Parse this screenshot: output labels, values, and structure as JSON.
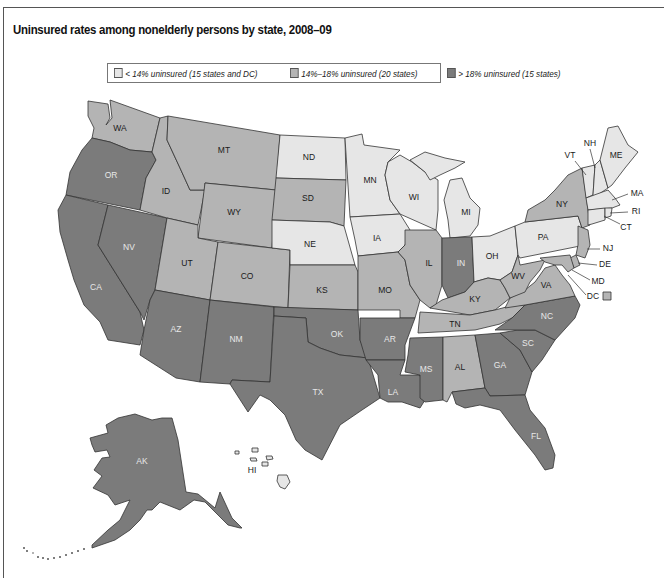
{
  "title": "Uninsured rates among nonelderly persons by state, 2008–09",
  "legend": {
    "items": [
      {
        "label": "< 14% uninsured (15 states and DC)",
        "color": "#e6e6e6",
        "category": "low"
      },
      {
        "label": "14%–18% uninsured (20 states)",
        "color": "#b4b4b4",
        "category": "mid"
      },
      {
        "label": "> 18% uninsured (15 states)",
        "color": "#7b7b7b",
        "category": "high"
      }
    ]
  },
  "colors": {
    "low": "#e6e6e6",
    "mid": "#b4b4b4",
    "high": "#7b7b7b",
    "border": "#333333",
    "frame": "#555555"
  },
  "states": {
    "WA": {
      "label": "WA",
      "category": "mid"
    },
    "OR": {
      "label": "OR",
      "category": "high"
    },
    "CA": {
      "label": "CA",
      "category": "high"
    },
    "NV": {
      "label": "NV",
      "category": "high"
    },
    "ID": {
      "label": "ID",
      "category": "mid"
    },
    "MT": {
      "label": "MT",
      "category": "mid"
    },
    "WY": {
      "label": "WY",
      "category": "mid"
    },
    "UT": {
      "label": "UT",
      "category": "mid"
    },
    "CO": {
      "label": "CO",
      "category": "mid"
    },
    "AZ": {
      "label": "AZ",
      "category": "high"
    },
    "NM": {
      "label": "NM",
      "category": "high"
    },
    "ND": {
      "label": "ND",
      "category": "low"
    },
    "SD": {
      "label": "SD",
      "category": "mid"
    },
    "NE": {
      "label": "NE",
      "category": "low"
    },
    "KS": {
      "label": "KS",
      "category": "mid"
    },
    "OK": {
      "label": "OK",
      "category": "high"
    },
    "TX": {
      "label": "TX",
      "category": "high"
    },
    "MN": {
      "label": "MN",
      "category": "low"
    },
    "IA": {
      "label": "IA",
      "category": "low"
    },
    "MO": {
      "label": "MO",
      "category": "mid"
    },
    "AR": {
      "label": "AR",
      "category": "high"
    },
    "LA": {
      "label": "LA",
      "category": "high"
    },
    "WI": {
      "label": "WI",
      "category": "low"
    },
    "IL": {
      "label": "IL",
      "category": "mid"
    },
    "MI": {
      "label": "MI",
      "category": "low"
    },
    "IN": {
      "label": "IN",
      "category": "high"
    },
    "OH": {
      "label": "OH",
      "category": "low"
    },
    "KY": {
      "label": "KY",
      "category": "mid"
    },
    "TN": {
      "label": "TN",
      "category": "mid"
    },
    "MS": {
      "label": "MS",
      "category": "high"
    },
    "AL": {
      "label": "AL",
      "category": "mid"
    },
    "GA": {
      "label": "GA",
      "category": "high"
    },
    "FL": {
      "label": "FL",
      "category": "high"
    },
    "SC": {
      "label": "SC",
      "category": "high"
    },
    "NC": {
      "label": "NC",
      "category": "high"
    },
    "VA": {
      "label": "VA",
      "category": "mid"
    },
    "WV": {
      "label": "WV",
      "category": "mid"
    },
    "PA": {
      "label": "PA",
      "category": "low"
    },
    "NY": {
      "label": "NY",
      "category": "mid"
    },
    "VT": {
      "label": "VT",
      "category": "low"
    },
    "NH": {
      "label": "NH",
      "category": "low"
    },
    "ME": {
      "label": "ME",
      "category": "low"
    },
    "MA": {
      "label": "MA",
      "category": "low"
    },
    "RI": {
      "label": "RI",
      "category": "low"
    },
    "CT": {
      "label": "CT",
      "category": "low"
    },
    "NJ": {
      "label": "NJ",
      "category": "mid"
    },
    "DE": {
      "label": "DE",
      "category": "mid"
    },
    "MD": {
      "label": "MD",
      "category": "mid"
    },
    "DC": {
      "label": "DC",
      "category": "mid"
    },
    "AK": {
      "label": "AK",
      "category": "high"
    },
    "HI": {
      "label": "HI",
      "category": "low"
    }
  }
}
